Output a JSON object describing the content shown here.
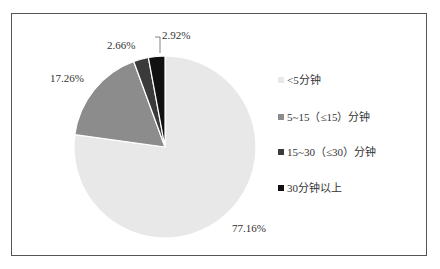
{
  "chart_data": {
    "type": "pie",
    "title": "",
    "start_angle": "12 o'clock, clockwise",
    "slices": [
      {
        "label": "<5分钟",
        "value": 77.16,
        "display": "77.16%",
        "color": "#e8e8e8"
      },
      {
        "label": "5~15（≤15）分钟",
        "value": 17.26,
        "display": "17.26%",
        "color": "#8c8c8c"
      },
      {
        "label": "15~30（≤30）分钟",
        "value": 2.66,
        "display": "2.66%",
        "color": "#3a3a3a"
      },
      {
        "label": "30分钟以上",
        "value": 2.92,
        "display": "2.92%",
        "color": "#111111"
      }
    ],
    "legend_position": "right"
  },
  "labels": {
    "s0": "77.16%",
    "s1": "17.26%",
    "s2": "2.66%",
    "s3": "2.92%"
  },
  "legend": {
    "items": [
      {
        "label": "<5分钟",
        "color": "#e8e8e8"
      },
      {
        "label": "5~15（≤15）分钟",
        "color": "#8c8c8c"
      },
      {
        "label": "15~30（≤30）分钟",
        "color": "#3a3a3a"
      },
      {
        "label": "30分钟以上",
        "color": "#111111"
      }
    ]
  }
}
